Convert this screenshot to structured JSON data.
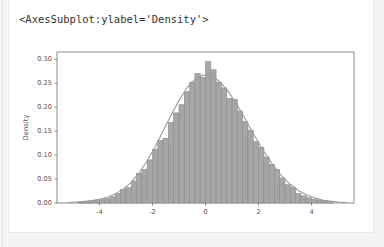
{
  "output": {
    "repr_text": "<AxesSubplot:ylabel='Density'>"
  },
  "colors": {
    "page_background": "#f4f4f5",
    "card_background": "#ffffff",
    "card_border": "#e6e6e9",
    "text": "#333333",
    "bar_fill": "#a6a6a6",
    "bar_edge": "#8a8a8a",
    "kde_line": "#9a9a9a",
    "axis_spine": "#6f6f6f",
    "tick_label": "#555555"
  },
  "chart_data": {
    "type": "bar",
    "title": "",
    "xlabel": "",
    "ylabel": "Density",
    "grid": false,
    "legend": null,
    "xlim": [
      -5.6,
      5.6
    ],
    "ylim": [
      0.0,
      0.315
    ],
    "xticks": [
      -4,
      -2,
      0,
      2,
      4
    ],
    "xtick_labels": [
      "-4",
      "-2",
      "0",
      "2",
      "4"
    ],
    "yticks": [
      0.0,
      0.05,
      0.1,
      0.15,
      0.2,
      0.25,
      0.3
    ],
    "ytick_labels": [
      "0.00",
      "0.05",
      "0.10",
      "0.15",
      "0.20",
      "0.25",
      "0.30"
    ],
    "bin_width": 0.2,
    "bin_centers": [
      -4.7,
      -4.5,
      -4.3,
      -4.1,
      -3.9,
      -3.7,
      -3.5,
      -3.3,
      -3.1,
      -2.9,
      -2.7,
      -2.5,
      -2.3,
      -2.1,
      -1.9,
      -1.7,
      -1.5,
      -1.3,
      -1.1,
      -0.9,
      -0.7,
      -0.5,
      -0.3,
      -0.1,
      0.1,
      0.3,
      0.5,
      0.7,
      0.9,
      1.1,
      1.3,
      1.5,
      1.7,
      1.9,
      2.1,
      2.3,
      2.5,
      2.7,
      2.9,
      3.1,
      3.3,
      3.5,
      3.7,
      3.9,
      4.1,
      4.3,
      4.5,
      4.7
    ],
    "values": [
      0.002,
      0.003,
      0.004,
      0.005,
      0.007,
      0.009,
      0.013,
      0.02,
      0.028,
      0.032,
      0.046,
      0.062,
      0.07,
      0.09,
      0.112,
      0.13,
      0.135,
      0.168,
      0.188,
      0.205,
      0.232,
      0.252,
      0.27,
      0.262,
      0.295,
      0.278,
      0.252,
      0.24,
      0.218,
      0.216,
      0.192,
      0.17,
      0.152,
      0.128,
      0.116,
      0.096,
      0.08,
      0.07,
      0.052,
      0.038,
      0.032,
      0.02,
      0.015,
      0.011,
      0.008,
      0.006,
      0.004,
      0.003
    ],
    "kde": {
      "name": "density-curve",
      "x": [
        -5.2,
        -4.9,
        -4.6,
        -4.3,
        -4.0,
        -3.7,
        -3.4,
        -3.1,
        -2.8,
        -2.5,
        -2.2,
        -1.9,
        -1.6,
        -1.3,
        -1.0,
        -0.7,
        -0.4,
        -0.1,
        0.2,
        0.5,
        0.8,
        1.1,
        1.4,
        1.7,
        2.0,
        2.3,
        2.6,
        2.9,
        3.2,
        3.5,
        3.8,
        4.1,
        4.4,
        4.7,
        5.0,
        5.3
      ],
      "y": [
        0.001,
        0.002,
        0.003,
        0.005,
        0.008,
        0.012,
        0.019,
        0.029,
        0.043,
        0.063,
        0.088,
        0.117,
        0.15,
        0.183,
        0.214,
        0.24,
        0.258,
        0.267,
        0.266,
        0.255,
        0.237,
        0.213,
        0.185,
        0.155,
        0.126,
        0.099,
        0.075,
        0.055,
        0.039,
        0.026,
        0.017,
        0.011,
        0.006,
        0.004,
        0.002,
        0.001
      ]
    }
  }
}
